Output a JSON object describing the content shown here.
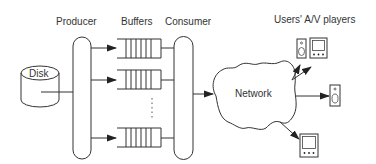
{
  "diagram": {
    "labels": {
      "producer": "Producer",
      "buffers": "Buffers",
      "consumer": "Consumer",
      "disk": "Disk",
      "network": "Network",
      "users_players": "Users' A/V players"
    },
    "nodes": [
      {
        "id": "disk",
        "label": "Disk",
        "shape": "cylinder"
      },
      {
        "id": "producer",
        "label": "Producer",
        "shape": "capsule"
      },
      {
        "id": "buffer-1",
        "label": "Buffers",
        "shape": "queue"
      },
      {
        "id": "buffer-2",
        "label": "Buffers",
        "shape": "queue"
      },
      {
        "id": "buffer-n",
        "label": "Buffers",
        "shape": "queue"
      },
      {
        "id": "consumer",
        "label": "Consumer",
        "shape": "capsule"
      },
      {
        "id": "network",
        "label": "Network",
        "shape": "cloud"
      },
      {
        "id": "player-speaker-top",
        "label": "Users' A/V players",
        "shape": "speaker-icon"
      },
      {
        "id": "player-monitor-top",
        "label": "Users' A/V players",
        "shape": "monitor-icon"
      },
      {
        "id": "player-speaker-right",
        "label": "Users' A/V players",
        "shape": "speaker-icon"
      },
      {
        "id": "player-monitor-bottom",
        "label": "Users' A/V players",
        "shape": "monitor-icon"
      }
    ],
    "edges": [
      {
        "from": "disk",
        "to": "producer",
        "arrow": false
      },
      {
        "from": "producer",
        "to": "buffer-1",
        "arrow": true
      },
      {
        "from": "producer",
        "to": "buffer-2",
        "arrow": true
      },
      {
        "from": "producer",
        "to": "buffer-n",
        "arrow": true
      },
      {
        "from": "buffer-1",
        "to": "consumer",
        "arrow": false
      },
      {
        "from": "buffer-2",
        "to": "consumer",
        "arrow": false
      },
      {
        "from": "buffer-n",
        "to": "consumer",
        "arrow": false
      },
      {
        "from": "consumer",
        "to": "network",
        "arrow": true
      },
      {
        "from": "network",
        "to": "player-speaker-top",
        "arrow": true
      },
      {
        "from": "network",
        "to": "player-monitor-top",
        "arrow": true
      },
      {
        "from": "network",
        "to": "player-speaker-right",
        "arrow": true
      },
      {
        "from": "network",
        "to": "player-monitor-bottom",
        "arrow": true
      }
    ],
    "ellipsis": "⋮",
    "colors": {
      "line": "#333333",
      "background": "#ffffff"
    }
  }
}
